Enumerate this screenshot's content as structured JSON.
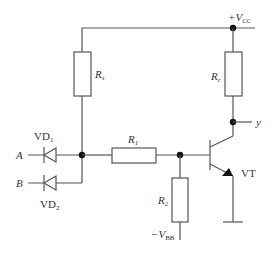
{
  "diagram": {
    "type": "circuit-schematic",
    "title": "",
    "colors": {
      "wire": "#555555",
      "junction": "#111111",
      "text": "#333333",
      "background": "#ffffff"
    },
    "labels": {
      "vcc": {
        "prefix": "+V",
        "sub": "CC"
      },
      "vbb": {
        "prefix": "−V",
        "sub": "BB"
      },
      "rs": {
        "main": "R",
        "sub": "s"
      },
      "rc": {
        "main": "R",
        "sub": "c"
      },
      "r1": {
        "main": "R",
        "sub": "1"
      },
      "r2": {
        "main": "R",
        "sub": "2"
      },
      "vd1": {
        "main": "VD",
        "sub": "1"
      },
      "vd2": {
        "main": "VD",
        "sub": "2"
      },
      "input_a": "A",
      "input_b": "B",
      "output_y": "y",
      "transistor": "VT"
    },
    "components": [
      {
        "id": "Rs",
        "kind": "resistor",
        "connects": [
          "+VCC",
          "node_AB"
        ]
      },
      {
        "id": "Rc",
        "kind": "resistor",
        "connects": [
          "+VCC",
          "y"
        ]
      },
      {
        "id": "VD1",
        "kind": "diode",
        "connects": [
          "A",
          "node_AB"
        ]
      },
      {
        "id": "VD2",
        "kind": "diode",
        "connects": [
          "B",
          "node_AB"
        ]
      },
      {
        "id": "R1",
        "kind": "resistor",
        "connects": [
          "node_AB",
          "base"
        ]
      },
      {
        "id": "R2",
        "kind": "resistor",
        "connects": [
          "base",
          "-VBB"
        ]
      },
      {
        "id": "VT",
        "kind": "npn-transistor",
        "connects": [
          "base",
          "y",
          "ground"
        ]
      }
    ]
  }
}
